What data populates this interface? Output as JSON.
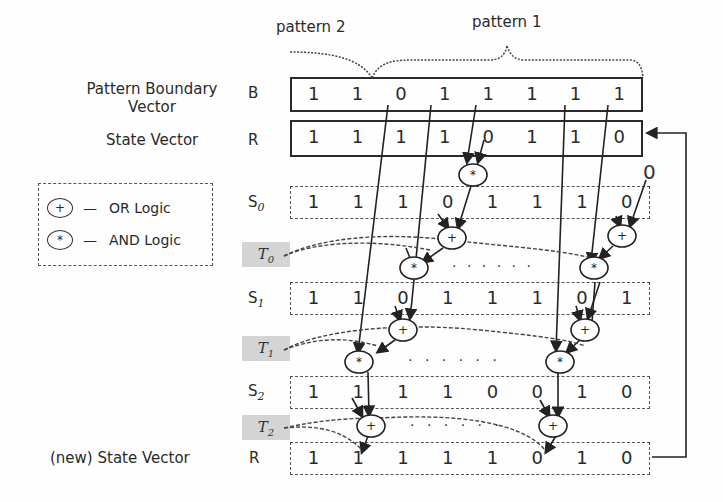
{
  "patterns": {
    "pattern2_label": "pattern 2",
    "pattern1_label": "pattern 1"
  },
  "rows": {
    "B": {
      "title": "Pattern Boundary\nVector",
      "title_line1": "Pattern Boundary",
      "title_line2": "Vector",
      "symbol": "B",
      "values": [
        "1",
        "1",
        "0",
        "1",
        "1",
        "1",
        "1",
        "1"
      ]
    },
    "R": {
      "title": "State Vector",
      "symbol": "R",
      "values": [
        "1",
        "1",
        "1",
        "1",
        "0",
        "1",
        "1",
        "0"
      ]
    },
    "S0": {
      "symbol": "S",
      "sub": "0",
      "values": [
        "1",
        "1",
        "1",
        "0",
        "1",
        "1",
        "1",
        "0"
      ]
    },
    "S1": {
      "symbol": "S",
      "sub": "1",
      "values": [
        "1",
        "1",
        "0",
        "1",
        "1",
        "1",
        "0",
        "1"
      ]
    },
    "S2": {
      "symbol": "S",
      "sub": "2",
      "values": [
        "1",
        "1",
        "1",
        "1",
        "0",
        "0",
        "1",
        "0"
      ]
    },
    "Rnew": {
      "title": "(new) State Vector",
      "symbol": "R",
      "values": [
        "1",
        "1",
        "1",
        "1",
        "1",
        "0",
        "1",
        "0"
      ]
    }
  },
  "temps": [
    {
      "symbol": "T",
      "sub": "0"
    },
    {
      "symbol": "T",
      "sub": "1"
    },
    {
      "symbol": "T",
      "sub": "2"
    }
  ],
  "legend": {
    "or_symbol": "+",
    "or_label": "OR  Logic",
    "and_symbol": "*",
    "and_label": "AND Logic",
    "dash": "—"
  },
  "extra_input": "0",
  "ellipsis": ". . . . . ."
}
